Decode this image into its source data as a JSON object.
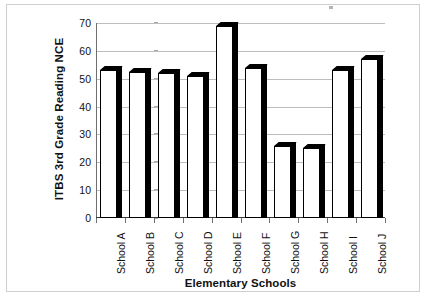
{
  "chart_data": {
    "type": "bar",
    "title": "",
    "subtitle": "",
    "xlabel": "Elementary Schools",
    "ylabel": "ITBS 3rd Grade Reading NCE",
    "categories": [
      "School A",
      "School B",
      "School C",
      "School D",
      "School E",
      "School F",
      "School G",
      "School H",
      "School I",
      "School J"
    ],
    "values": [
      53,
      52.5,
      52,
      51,
      69,
      54,
      26,
      25,
      53,
      57
    ],
    "series": [
      {
        "name": "ITBS 3rd Grade Reading NCE",
        "values": [
          53,
          52.5,
          52,
          51,
          69,
          54,
          26,
          25,
          53,
          57
        ]
      }
    ],
    "ylim": [
      0,
      70
    ],
    "y_ticks": [
      0,
      10,
      20,
      30,
      40,
      50,
      60,
      70
    ],
    "y_tick_labels": [
      "0",
      "10",
      "20",
      "30",
      "40",
      "50",
      "60",
      "70"
    ],
    "grid": true,
    "grid_axis": "y",
    "legend": false,
    "legend_position": "none",
    "bar_style": "3d-white-fill-black-outline",
    "x_label_rotation": -90,
    "colors": {
      "bar_fill": "#ffffff",
      "bar_outline": "#000000",
      "bar_shadow": "#000000",
      "gridline": "#bdbdbd",
      "axis": "#3a3a3a",
      "text": "#111111",
      "frame_border": "#cfcfcf",
      "background": "#ffffff"
    }
  }
}
